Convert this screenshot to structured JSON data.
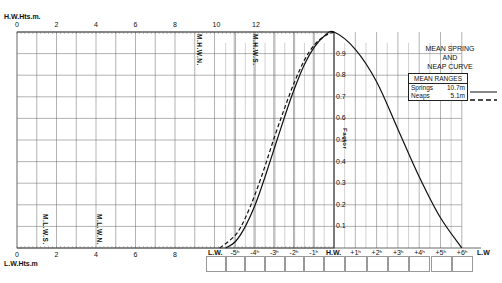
{
  "chart_data": {
    "type": "line",
    "title": "MEAN SPRING AND NEAP CURVE",
    "title_lines": [
      "MEAN SPRING",
      "AND",
      "NEAP CURVE"
    ],
    "top_axis": {
      "label": "H.W.Hts.m.",
      "ticks": [
        "0",
        "2",
        "4",
        "6",
        "8",
        "10",
        "12"
      ]
    },
    "bottom_axis": {
      "label": "L.W.Hts.m",
      "ticks": [
        "0",
        "2",
        "4",
        "6",
        "8"
      ]
    },
    "height_markers": [
      {
        "label": "M.H.W.N.",
        "value_m": 9.5,
        "axis": "H.W."
      },
      {
        "label": "M.H.W.S.",
        "value_m": 12.2,
        "axis": "H.W."
      },
      {
        "label": "M.L.W.S.",
        "value_m": 1.4,
        "axis": "L.W."
      },
      {
        "label": "M.L.W.N.",
        "value_m": 4.1,
        "axis": "L.W."
      }
    ],
    "factor_axis": {
      "label": "Factor",
      "ticks": [
        "0.1",
        "0.2",
        "0.3",
        "0.4",
        "0.5",
        "0.6",
        "0.7",
        "0.8",
        "0.9"
      ],
      "ylim": [
        0,
        1
      ]
    },
    "time_axis": {
      "ticks": [
        "L.W.",
        "-5h",
        "-4h",
        "-3h",
        "-2h",
        "-1h",
        "H.W.",
        "+1h",
        "+2h",
        "+3h",
        "+4h",
        "+5h",
        "+6h",
        "L.W"
      ]
    },
    "legend": {
      "heading": "MEAN RANGES",
      "entries": [
        {
          "name": "Springs",
          "value": "10.7m",
          "style": "solid"
        },
        {
          "name": "Neaps",
          "value": "5.1m",
          "style": "dashed"
        }
      ]
    },
    "series": [
      {
        "name": "Springs",
        "x_hours": [
          -5.5,
          -5,
          -4.5,
          -4,
          -3.5,
          -3,
          -2.5,
          -2,
          -1.5,
          -1,
          -0.5,
          0,
          1,
          2,
          3,
          4,
          5,
          6
        ],
        "factor": [
          0.0,
          0.03,
          0.1,
          0.2,
          0.33,
          0.47,
          0.61,
          0.74,
          0.85,
          0.93,
          0.98,
          1.0,
          0.92,
          0.77,
          0.55,
          0.33,
          0.14,
          0.0
        ]
      },
      {
        "name": "Neaps",
        "x_hours": [
          -5.8,
          -5,
          -4.5,
          -4,
          -3.5,
          -3,
          -2.5,
          -2,
          -1.5,
          -1,
          -0.5,
          0
        ],
        "factor": [
          0.0,
          0.06,
          0.14,
          0.25,
          0.38,
          0.52,
          0.65,
          0.77,
          0.87,
          0.94,
          0.98,
          1.0
        ]
      }
    ]
  }
}
